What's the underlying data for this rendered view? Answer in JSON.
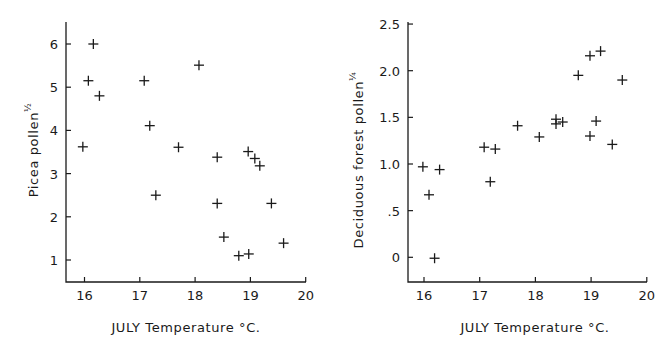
{
  "chart_data": [
    {
      "type": "scatter",
      "title": "",
      "xlabel": "JULY  Temperature °C.",
      "ylabel": "Picea  pollen",
      "ylabel_exponent": "½",
      "xlim": [
        15.7,
        20
      ],
      "ylim": [
        0.5,
        6.5
      ],
      "xticks": [
        16,
        17,
        18,
        19,
        20
      ],
      "xtick_labels": [
        "16",
        "17",
        "18",
        "19",
        "20"
      ],
      "yticks": [
        1,
        2,
        3,
        4,
        5,
        6
      ],
      "ytick_labels": [
        "1",
        "2",
        "3",
        "4",
        "5",
        "6"
      ],
      "grid": false,
      "legend": null,
      "marker": "+",
      "points": [
        {
          "x": 16.16,
          "y": 6.0
        },
        {
          "x": 16.07,
          "y": 5.15
        },
        {
          "x": 16.27,
          "y": 4.8
        },
        {
          "x": 15.97,
          "y": 3.62
        },
        {
          "x": 17.08,
          "y": 5.15
        },
        {
          "x": 17.18,
          "y": 4.11
        },
        {
          "x": 17.29,
          "y": 2.5
        },
        {
          "x": 17.7,
          "y": 3.61
        },
        {
          "x": 18.07,
          "y": 5.51
        },
        {
          "x": 18.4,
          "y": 3.38
        },
        {
          "x": 18.4,
          "y": 2.31
        },
        {
          "x": 18.52,
          "y": 1.53
        },
        {
          "x": 18.79,
          "y": 1.1
        },
        {
          "x": 18.97,
          "y": 1.14
        },
        {
          "x": 18.96,
          "y": 3.51
        },
        {
          "x": 19.08,
          "y": 3.35
        },
        {
          "x": 19.17,
          "y": 3.18
        },
        {
          "x": 19.38,
          "y": 2.31
        },
        {
          "x": 19.6,
          "y": 1.39
        }
      ]
    },
    {
      "type": "scatter",
      "title": "",
      "xlabel": "JULY  Temperature °C.",
      "ylabel": "Deciduous  forest  pollen",
      "ylabel_exponent": "¼",
      "xlim": [
        15.7,
        20
      ],
      "ylim": [
        -0.25,
        2.5
      ],
      "xticks": [
        16,
        17,
        18,
        19,
        20
      ],
      "xtick_labels": [
        "16",
        "17",
        "18",
        "19",
        "20"
      ],
      "yticks": [
        0,
        0.5,
        1.0,
        1.5,
        2.0,
        2.5
      ],
      "ytick_labels": [
        "0",
        ".5",
        "1.0",
        "1.5",
        "2.0",
        "2.5"
      ],
      "grid": false,
      "legend": null,
      "marker": "+",
      "points": [
        {
          "x": 15.98,
          "y": 0.97
        },
        {
          "x": 16.28,
          "y": 0.94
        },
        {
          "x": 16.09,
          "y": 0.67
        },
        {
          "x": 16.19,
          "y": -0.01
        },
        {
          "x": 17.08,
          "y": 1.18
        },
        {
          "x": 17.28,
          "y": 1.16
        },
        {
          "x": 17.19,
          "y": 0.81
        },
        {
          "x": 17.68,
          "y": 1.41
        },
        {
          "x": 18.07,
          "y": 1.29
        },
        {
          "x": 18.37,
          "y": 1.48
        },
        {
          "x": 18.37,
          "y": 1.43
        },
        {
          "x": 18.49,
          "y": 1.45
        },
        {
          "x": 18.77,
          "y": 1.95
        },
        {
          "x": 18.98,
          "y": 2.16
        },
        {
          "x": 19.17,
          "y": 2.21
        },
        {
          "x": 19.56,
          "y": 1.9
        },
        {
          "x": 19.09,
          "y": 1.46
        },
        {
          "x": 18.98,
          "y": 1.3
        },
        {
          "x": 19.38,
          "y": 1.21
        }
      ]
    }
  ],
  "layout": {
    "left": {
      "axis_x0": 66,
      "axis_x1": 306,
      "axis_y_top": 22,
      "axis_y_bottom": 282,
      "x_px_16": 84.5,
      "x_px_per_unit": 55.3,
      "y_px_1": 260,
      "y_px_per_unit": 43.2
    },
    "right": {
      "axis_x0": 408,
      "axis_x1": 647,
      "axis_y_top": 22,
      "axis_y_bottom": 282,
      "x_px_16": 424,
      "x_px_per_unit": 55.7,
      "y_px_0": 257.3,
      "y_px_per_unit": 93.3
    }
  }
}
